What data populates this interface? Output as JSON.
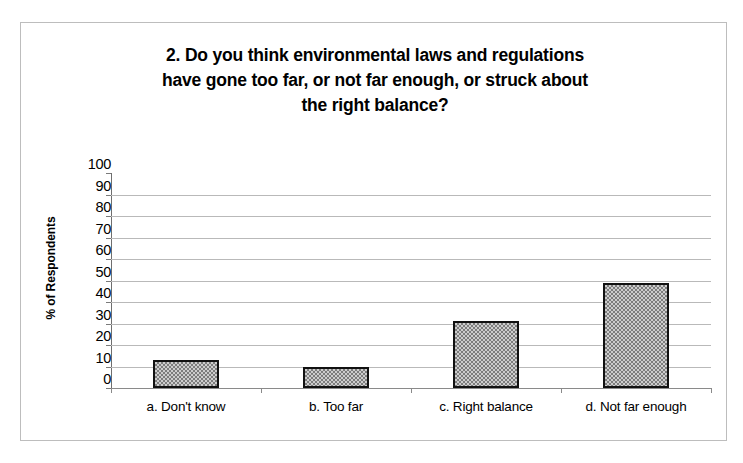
{
  "chart_data": {
    "type": "bar",
    "title": "2. Do you think environmental laws and regulations have gone too far, or not far enough, or struck about the right balance?",
    "title_lines": [
      "2. Do you think environmental laws and regulations",
      "have gone too far, or not far enough, or struck about",
      "the right balance?"
    ],
    "categories": [
      "a. Don't know",
      "b. Too far",
      "c. Right balance",
      "d. Not far enough"
    ],
    "values": [
      13,
      10,
      31,
      49
    ],
    "xlabel": "",
    "ylabel": "% of Respondents",
    "ylim": [
      0,
      100
    ],
    "ytick_labels": [
      "100",
      "90",
      "80",
      "70",
      "60",
      "50",
      "40",
      "30",
      "20",
      "10",
      "0"
    ],
    "ytick_values": [
      100,
      90,
      80,
      70,
      60,
      50,
      40,
      30,
      20,
      10,
      0
    ],
    "ytick_step": 10,
    "gridlines": [
      90,
      80,
      70,
      60,
      50,
      40,
      30,
      20,
      10
    ],
    "grid": true,
    "legend": false,
    "legend_position": "none",
    "bar_fill_color": "#b0b0b0",
    "bar_border_color": "#111111",
    "gridline_color": "#b9b9b9",
    "axis_color": "#7a7a7a",
    "background_color": "#ffffff",
    "frame_border_color": "#bdbdbd"
  }
}
